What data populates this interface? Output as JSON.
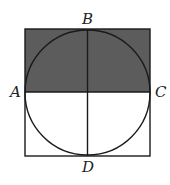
{
  "diagram": {
    "type": "geometry",
    "colors": {
      "background": "#ffffff",
      "shade": "#5c5c5c",
      "stroke": "#1a1a1a",
      "label": "#222222"
    },
    "square": {
      "x": 25,
      "y": 29,
      "width": 125,
      "height": 127
    },
    "circle": {
      "cx": 87.5,
      "cy": 92.5,
      "r": 62.5
    },
    "shaded_region": "top half of square (above segment AC)",
    "points": [
      {
        "name": "A",
        "label": "A",
        "x": 25,
        "y": 92
      },
      {
        "name": "B",
        "label": "B",
        "x": 87.5,
        "y": 29
      },
      {
        "name": "C",
        "label": "C",
        "x": 150,
        "y": 92
      },
      {
        "name": "D",
        "label": "D",
        "x": 87.5,
        "y": 156
      }
    ],
    "segments": [
      "AC",
      "BD"
    ]
  },
  "labels": {
    "a": "A",
    "b": "B",
    "c": "C",
    "d": "D"
  }
}
